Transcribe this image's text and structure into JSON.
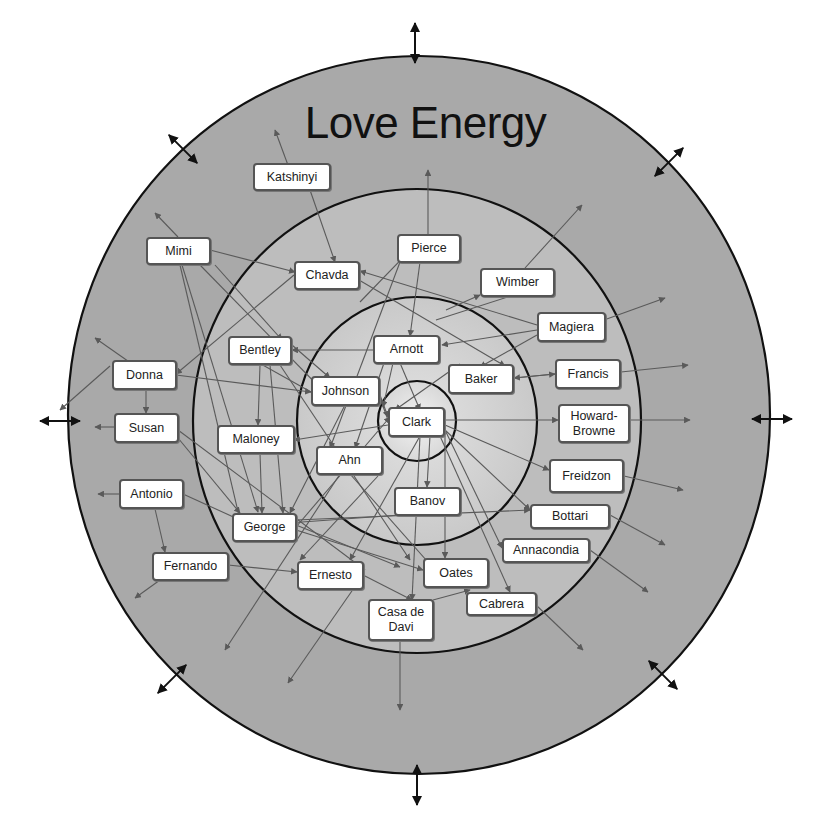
{
  "title": "Love Energy",
  "colors": {
    "outer_ring": "#a9a9a9",
    "middle_ring": "#bdbdbd",
    "inner_ring": "#d2d2d2",
    "core": "#e4e4e4",
    "ring_stroke": "#111111",
    "arrow": "#5a5a5a",
    "node_bg": "#ffffff",
    "node_border": "#555555"
  },
  "rings": [
    {
      "name": "outer",
      "cx": 419,
      "cy": 415,
      "rx": 351,
      "ry": 359
    },
    {
      "name": "middle",
      "cx": 417,
      "cy": 421,
      "rx": 224,
      "ry": 232
    },
    {
      "name": "inner",
      "cx": 417,
      "cy": 421,
      "rx": 120,
      "ry": 124
    },
    {
      "name": "core",
      "cx": 417,
      "cy": 421,
      "rx": 39,
      "ry": 40
    }
  ],
  "expansion_arrows": [
    {
      "direction": "up",
      "x": 415,
      "y": 43
    },
    {
      "direction": "down",
      "x": 417,
      "y": 785
    },
    {
      "direction": "left",
      "x": 60,
      "y": 421
    },
    {
      "direction": "right",
      "x": 772,
      "y": 419
    },
    {
      "direction": "up-left",
      "x": 183,
      "y": 149
    },
    {
      "direction": "up-right",
      "x": 669,
      "y": 162
    },
    {
      "direction": "down-left",
      "x": 172,
      "y": 679
    },
    {
      "direction": "down-right",
      "x": 663,
      "y": 675
    }
  ],
  "nodes": [
    {
      "id": "katshinyi",
      "label": "Katshinyi",
      "x": 253,
      "y": 163,
      "w": 78,
      "h": 28
    },
    {
      "id": "mimi",
      "label": "Mimi",
      "x": 146,
      "y": 237,
      "w": 65,
      "h": 28
    },
    {
      "id": "chavda",
      "label": "Chavda",
      "x": 294,
      "y": 261,
      "w": 66,
      "h": 29
    },
    {
      "id": "pierce",
      "label": "Pierce",
      "x": 397,
      "y": 234,
      "w": 64,
      "h": 29
    },
    {
      "id": "wimber",
      "label": "Wimber",
      "x": 480,
      "y": 268,
      "w": 75,
      "h": 29
    },
    {
      "id": "magiera",
      "label": "Magiera",
      "x": 537,
      "y": 312,
      "w": 69,
      "h": 30
    },
    {
      "id": "bentley",
      "label": "Bentley",
      "x": 228,
      "y": 336,
      "w": 64,
      "h": 29
    },
    {
      "id": "arnott",
      "label": "Arnott",
      "x": 373,
      "y": 335,
      "w": 67,
      "h": 29
    },
    {
      "id": "baker",
      "label": "Baker",
      "x": 448,
      "y": 364,
      "w": 66,
      "h": 30
    },
    {
      "id": "francis",
      "label": "Francis",
      "x": 555,
      "y": 359,
      "w": 66,
      "h": 30
    },
    {
      "id": "donna",
      "label": "Donna",
      "x": 112,
      "y": 360,
      "w": 65,
      "h": 30
    },
    {
      "id": "johnson",
      "label": "Johnson",
      "x": 311,
      "y": 376,
      "w": 69,
      "h": 30
    },
    {
      "id": "clark",
      "label": "Clark",
      "x": 388,
      "y": 407,
      "w": 57,
      "h": 30
    },
    {
      "id": "howard-browne",
      "label": "Howard-\nBrowne",
      "x": 558,
      "y": 404,
      "w": 72,
      "h": 39
    },
    {
      "id": "susan",
      "label": "Susan",
      "x": 114,
      "y": 413,
      "w": 65,
      "h": 30
    },
    {
      "id": "maloney",
      "label": "Maloney",
      "x": 217,
      "y": 425,
      "w": 78,
      "h": 29
    },
    {
      "id": "ahn",
      "label": "Ahn",
      "x": 316,
      "y": 446,
      "w": 67,
      "h": 29
    },
    {
      "id": "freidzon",
      "label": "Freidzon",
      "x": 549,
      "y": 459,
      "w": 75,
      "h": 34
    },
    {
      "id": "antonio",
      "label": "Antonio",
      "x": 119,
      "y": 479,
      "w": 65,
      "h": 30
    },
    {
      "id": "banov",
      "label": "Banov",
      "x": 394,
      "y": 487,
      "w": 67,
      "h": 29
    },
    {
      "id": "bottari",
      "label": "Bottari",
      "x": 530,
      "y": 504,
      "w": 80,
      "h": 25
    },
    {
      "id": "george",
      "label": "George",
      "x": 232,
      "y": 513,
      "w": 65,
      "h": 29
    },
    {
      "id": "annacondia",
      "label": "Annacondia",
      "x": 502,
      "y": 538,
      "w": 88,
      "h": 25
    },
    {
      "id": "fernando",
      "label": "Fernando",
      "x": 152,
      "y": 552,
      "w": 77,
      "h": 29
    },
    {
      "id": "ernesto",
      "label": "Ernesto",
      "x": 297,
      "y": 561,
      "w": 67,
      "h": 29
    },
    {
      "id": "oates",
      "label": "Oates",
      "x": 423,
      "y": 558,
      "w": 66,
      "h": 30
    },
    {
      "id": "cabrera",
      "label": "Cabrera",
      "x": 466,
      "y": 592,
      "w": 71,
      "h": 24
    },
    {
      "id": "casa-de-davi",
      "label": "Casa de\nDavi",
      "x": 368,
      "y": 599,
      "w": 66,
      "h": 42
    }
  ],
  "edges": [
    [
      292,
      176,
      275,
      130
    ],
    [
      310,
      190,
      335,
      262
    ],
    [
      178,
      237,
      155,
      213
    ],
    [
      210,
      250,
      295,
      272
    ],
    [
      180,
      265,
      240,
      520
    ],
    [
      182,
      265,
      258,
      512
    ],
    [
      200,
      265,
      330,
      398
    ],
    [
      215,
      265,
      282,
      340
    ],
    [
      428,
      234,
      428,
      170
    ],
    [
      420,
      262,
      410,
      336
    ],
    [
      400,
      262,
      330,
      448
    ],
    [
      525,
      268,
      582,
      205
    ],
    [
      446,
      310,
      480,
      295
    ],
    [
      436,
      320,
      545,
      285
    ],
    [
      604,
      320,
      665,
      298
    ],
    [
      537,
      330,
      442,
      345
    ],
    [
      537,
      325,
      360,
      271
    ],
    [
      537,
      335,
      480,
      367
    ],
    [
      359,
      280,
      505,
      366
    ],
    [
      294,
      275,
      176,
      374
    ],
    [
      373,
      350,
      292,
      350
    ],
    [
      400,
      363,
      420,
      410
    ],
    [
      384,
      363,
      355,
      448
    ],
    [
      393,
      363,
      383,
      407
    ],
    [
      514,
      378,
      555,
      374
    ],
    [
      621,
      372,
      688,
      365
    ],
    [
      555,
      374,
      514,
      378
    ],
    [
      460,
      364,
      395,
      410
    ],
    [
      176,
      375,
      311,
      392
    ],
    [
      146,
      390,
      146,
      413
    ],
    [
      135,
      366,
      95,
      338
    ],
    [
      114,
      427,
      95,
      427
    ],
    [
      119,
      494,
      98,
      494
    ],
    [
      155,
      509,
      165,
      552
    ],
    [
      160,
      580,
      135,
      598
    ],
    [
      228,
      565,
      297,
      572
    ],
    [
      296,
      527,
      390,
      417
    ],
    [
      296,
      520,
      530,
      510
    ],
    [
      296,
      525,
      400,
      567
    ],
    [
      296,
      530,
      423,
      570
    ],
    [
      292,
      350,
      270,
      350
    ],
    [
      260,
      365,
      258,
      425
    ],
    [
      260,
      453,
      262,
      513
    ],
    [
      270,
      365,
      283,
      513
    ],
    [
      280,
      365,
      410,
      560
    ],
    [
      292,
      345,
      330,
      378
    ],
    [
      311,
      392,
      236,
      350
    ],
    [
      380,
      395,
      388,
      417
    ],
    [
      388,
      420,
      380,
      398
    ],
    [
      388,
      425,
      294,
      440
    ],
    [
      345,
      405,
      290,
      513
    ],
    [
      378,
      476,
      300,
      560
    ],
    [
      340,
      474,
      225,
      650
    ],
    [
      350,
      474,
      450,
      587
    ],
    [
      430,
      436,
      427,
      487
    ],
    [
      420,
      436,
      412,
      600
    ],
    [
      420,
      436,
      350,
      560
    ],
    [
      445,
      420,
      558,
      420
    ],
    [
      630,
      420,
      690,
      420
    ],
    [
      445,
      425,
      549,
      470
    ],
    [
      624,
      476,
      683,
      490
    ],
    [
      445,
      430,
      530,
      510
    ],
    [
      610,
      515,
      665,
      545
    ],
    [
      445,
      430,
      502,
      548
    ],
    [
      590,
      550,
      648,
      592
    ],
    [
      440,
      436,
      510,
      592
    ],
    [
      536,
      605,
      583,
      650
    ],
    [
      445,
      436,
      445,
      558
    ],
    [
      400,
      640,
      400,
      710
    ],
    [
      363,
      575,
      288,
      683
    ],
    [
      363,
      575,
      412,
      600
    ],
    [
      433,
      600,
      470,
      590
    ],
    [
      178,
      438,
      240,
      513
    ],
    [
      178,
      430,
      365,
      570
    ],
    [
      183,
      494,
      240,
      520
    ],
    [
      110,
      366,
      60,
      410
    ],
    [
      400,
      515,
      260,
      525
    ],
    [
      415,
      515,
      428,
      487
    ],
    [
      360,
      302,
      420,
      240
    ]
  ]
}
